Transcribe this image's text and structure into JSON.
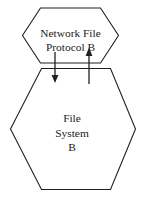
{
  "diagram": {
    "type": "stacked-hexagon-layer-diagram",
    "background_color": "#ffffff",
    "stroke_color": "#231f20",
    "text_color": "#1a1a1a",
    "upper_node": {
      "shape": "hexagon",
      "label_lines": [
        "Network File",
        "Protocol B"
      ],
      "line1": "Network File",
      "line2": "Protocol B"
    },
    "lower_node": {
      "shape": "hexagon",
      "label_lines": [
        "File",
        "System",
        "B"
      ],
      "line1": "File",
      "line2": "System",
      "line3": "B"
    },
    "arrows": [
      {
        "name": "downward-arrow",
        "direction": "down",
        "from": "Network File Protocol B",
        "to": "File System B"
      },
      {
        "name": "upward-arrow",
        "direction": "up",
        "from": "File System B",
        "to": "Network File Protocol B"
      }
    ]
  }
}
